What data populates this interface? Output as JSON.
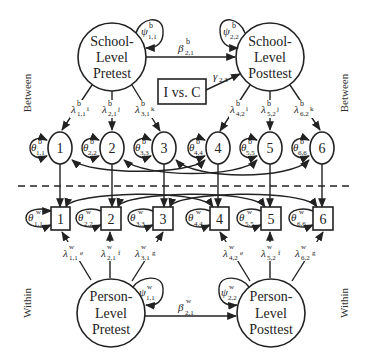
{
  "levels": {
    "between_left": "Between",
    "between_right": "Between",
    "within_left": "Within",
    "within_right": "Within"
  },
  "latent": {
    "school_pretest": [
      "School-",
      "Level",
      "Pretest"
    ],
    "school_posttest": [
      "School-",
      "Level",
      "Posttest"
    ],
    "person_pretest": [
      "Person-",
      "Level",
      "Pretest"
    ],
    "person_posttest": [
      "Person-",
      "Level",
      "Posttest"
    ]
  },
  "covariate": {
    "label": "I vs. C"
  },
  "paths": {
    "beta_b": {
      "sym": "β",
      "sup": "b",
      "sub": "2,1"
    },
    "beta_w": {
      "sym": "β",
      "sup": "w",
      "sub": "2,1"
    },
    "gamma": {
      "sym": "γ",
      "sub": "2,3"
    },
    "psi_b11": {
      "sym": "ψ",
      "sup": "b",
      "sub": "1,1"
    },
    "psi_b22": {
      "sym": "ψ",
      "sup": "b",
      "sub": "2,2"
    },
    "psi_w11": {
      "sym": "ψ",
      "sup": "w",
      "sub": "1,1"
    },
    "psi_w22": {
      "sym": "ψ",
      "sup": "w",
      "sub": "2,2"
    }
  },
  "between_loadings": [
    {
      "sym": "λ",
      "sup": "b",
      "sub": "1,1",
      "tag": "i"
    },
    {
      "sym": "λ",
      "sup": "b",
      "sub": "2,1",
      "tag": "j"
    },
    {
      "sym": "λ",
      "sup": "b",
      "sub": "3,1",
      "tag": "k"
    },
    {
      "sym": "λ",
      "sup": "b",
      "sub": "4,2",
      "tag": "i"
    },
    {
      "sym": "λ",
      "sup": "b",
      "sub": "5,2",
      "tag": "j"
    },
    {
      "sym": "λ",
      "sup": "b",
      "sub": "6,2",
      "tag": "k"
    }
  ],
  "within_loadings": [
    {
      "sym": "λ",
      "sup": "w",
      "sub": "1,1",
      "tag": "e"
    },
    {
      "sym": "λ",
      "sup": "w",
      "sub": "2,1",
      "tag": "f"
    },
    {
      "sym": "λ",
      "sup": "w",
      "sub": "3,1",
      "tag": "g"
    },
    {
      "sym": "λ",
      "sup": "w",
      "sub": "4,2",
      "tag": "e"
    },
    {
      "sym": "λ",
      "sup": "w",
      "sub": "5,2",
      "tag": "f"
    },
    {
      "sym": "λ",
      "sup": "w",
      "sub": "6,2",
      "tag": "g"
    }
  ],
  "between_indicators": [
    {
      "label": "1",
      "theta": {
        "sym": "θ",
        "sup": "b",
        "sub": "1,1"
      }
    },
    {
      "label": "2",
      "theta": {
        "sym": "θ",
        "sup": "b",
        "sub": "2,2"
      }
    },
    {
      "label": "3",
      "theta": {
        "sym": "θ",
        "sup": "b",
        "sub": "3,3"
      }
    },
    {
      "label": "4",
      "theta": {
        "sym": "θ",
        "sup": "b",
        "sub": "4,4"
      }
    },
    {
      "label": "5",
      "theta": {
        "sym": "θ",
        "sup": "b",
        "sub": "5,5"
      }
    },
    {
      "label": "6",
      "theta": {
        "sym": "θ",
        "sup": "b",
        "sub": "6,6"
      }
    }
  ],
  "within_indicators": [
    {
      "label": "1",
      "theta": {
        "sym": "θ",
        "sup": "w",
        "sub": "1,1"
      }
    },
    {
      "label": "2",
      "theta": {
        "sym": "θ",
        "sup": "w",
        "sub": "2,2"
      }
    },
    {
      "label": "3",
      "theta": {
        "sym": "θ",
        "sup": "w",
        "sub": "3,3"
      }
    },
    {
      "label": "4",
      "theta": {
        "sym": "θ",
        "sup": "w",
        "sub": "4,4"
      }
    },
    {
      "label": "5",
      "theta": {
        "sym": "θ",
        "sup": "w",
        "sub": "5,5"
      }
    },
    {
      "label": "6",
      "theta": {
        "sym": "θ",
        "sup": "w",
        "sub": "6,6"
      }
    }
  ]
}
